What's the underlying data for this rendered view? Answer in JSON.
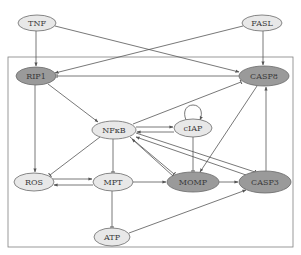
{
  "colors": {
    "light_node": "#e8e8e8",
    "dark_node": "#9a9a9a",
    "node_stroke": "#6a6a6a",
    "edge": "#555555",
    "frame": "#808080"
  },
  "frame": {
    "x": 8,
    "y": 57,
    "w": 285,
    "h": 190
  },
  "nodes": [
    {
      "id": "TNF",
      "label": "TNF",
      "x": 37,
      "y": 23,
      "rx": 19,
      "ry": 8,
      "style": "light"
    },
    {
      "id": "FASL",
      "label": "FASL",
      "x": 262,
      "y": 23,
      "rx": 20,
      "ry": 8,
      "style": "light"
    },
    {
      "id": "RIP1",
      "label": "RIP1",
      "x": 36,
      "y": 76,
      "rx": 20,
      "ry": 9,
      "style": "dark"
    },
    {
      "id": "CASP8",
      "label": "CASP8",
      "x": 264,
      "y": 76,
      "rx": 25,
      "ry": 10,
      "style": "dark"
    },
    {
      "id": "NFkB",
      "label": "NFκB",
      "x": 114,
      "y": 130,
      "rx": 22,
      "ry": 9,
      "style": "light"
    },
    {
      "id": "cIAP",
      "label": "cIAP",
      "x": 193,
      "y": 128,
      "rx": 19,
      "ry": 9,
      "style": "light"
    },
    {
      "id": "ROS",
      "label": "ROS",
      "x": 34,
      "y": 182,
      "rx": 20,
      "ry": 9,
      "style": "light"
    },
    {
      "id": "MPT",
      "label": "MPT",
      "x": 113,
      "y": 182,
      "rx": 20,
      "ry": 9,
      "style": "light"
    },
    {
      "id": "MOMP",
      "label": "MOMP",
      "x": 193,
      "y": 182,
      "rx": 26,
      "ry": 10,
      "style": "dark"
    },
    {
      "id": "CASP3",
      "label": "CASP3",
      "x": 265,
      "y": 182,
      "rx": 26,
      "ry": 11,
      "style": "dark"
    },
    {
      "id": "ATP",
      "label": "ATP",
      "x": 112,
      "y": 237,
      "rx": 18,
      "ry": 9,
      "style": "light"
    }
  ],
  "edges": [
    {
      "from": "TNF",
      "to": "RIP1",
      "type": "activation"
    },
    {
      "from": "TNF",
      "to": "CASP8",
      "type": "activation"
    },
    {
      "from": "FASL",
      "to": "RIP1",
      "type": "activation"
    },
    {
      "from": "FASL",
      "to": "CASP8",
      "type": "activation"
    },
    {
      "from": "CASP8",
      "to": "RIP1",
      "type": "inhibition"
    },
    {
      "from": "RIP1",
      "to": "NFkB",
      "type": "activation"
    },
    {
      "from": "RIP1",
      "to": "ROS",
      "type": "activation"
    },
    {
      "from": "NFkB",
      "to": "CASP8",
      "type": "inhibition"
    },
    {
      "from": "NFkB",
      "to": "cIAP",
      "type": "activation"
    },
    {
      "from": "cIAP",
      "to": "NFkB",
      "type": "activation"
    },
    {
      "from": "cIAP",
      "to": "cIAP",
      "type": "self-loop"
    },
    {
      "from": "NFkB",
      "to": "ROS",
      "type": "inhibition"
    },
    {
      "from": "NFkB",
      "to": "MPT",
      "type": "inhibition"
    },
    {
      "from": "NFkB",
      "to": "MOMP",
      "type": "inhibition"
    },
    {
      "from": "NFkB",
      "to": "CASP3",
      "type": "inhibition"
    },
    {
      "from": "CASP3",
      "to": "NFkB",
      "type": "activation"
    },
    {
      "from": "MOMP",
      "to": "NFkB",
      "type": "activation"
    },
    {
      "from": "ROS",
      "to": "MPT",
      "type": "activation"
    },
    {
      "from": "MPT",
      "to": "ROS",
      "type": "activation"
    },
    {
      "from": "MPT",
      "to": "MOMP",
      "type": "activation"
    },
    {
      "from": "MPT",
      "to": "ATP",
      "type": "inhibition"
    },
    {
      "from": "cIAP",
      "to": "MOMP",
      "type": "inhibition"
    },
    {
      "from": "CASP8",
      "to": "MOMP",
      "type": "activation"
    },
    {
      "from": "MOMP",
      "to": "CASP3",
      "type": "activation"
    },
    {
      "from": "ATP",
      "to": "CASP3",
      "type": "activation"
    },
    {
      "from": "CASP3",
      "to": "CASP8",
      "type": "activation"
    }
  ]
}
